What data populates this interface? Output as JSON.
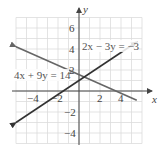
{
  "chart_data": {
    "type": "line",
    "title": "",
    "xlabel": "x",
    "ylabel": "y",
    "xlim": [
      -6,
      6
    ],
    "ylim": [
      -5,
      7
    ],
    "grid": true,
    "x_ticks": [
      -4,
      -2,
      2,
      4
    ],
    "y_ticks": [
      6,
      4,
      2,
      -2,
      -4
    ],
    "x_tick_labels": [
      "−4",
      "−2",
      "2",
      "4"
    ],
    "y_tick_labels": [
      "6",
      "4",
      "2",
      "−2",
      "−4"
    ],
    "series": [
      {
        "name": "2x − 3y = −3",
        "equation": "2x - 3y = -3",
        "color": "#333333",
        "x": [
          -6,
          5.5
        ],
        "y": [
          -3,
          4.667
        ]
      },
      {
        "name": "4x + 9y = 14",
        "equation": "4x + 9y = 14",
        "color": "#666666",
        "x": [
          -6,
          5.5
        ],
        "y": [
          4.222,
          -0.889
        ]
      }
    ],
    "annotations": [
      {
        "text": "2x − 3y = −3",
        "x": 0.6,
        "y": 4
      },
      {
        "text": "4x + 9y = 14",
        "x": -5.8,
        "y": 1.2
      }
    ],
    "intersection": {
      "x": 0.5,
      "y": 1.333
    }
  },
  "labels": {
    "eq1": "2x − 3y = −3",
    "eq2": "4x + 9y = 14",
    "x_axis": "x",
    "y_axis": "y",
    "xt0": "−4",
    "xt1": "−2",
    "xt2": "2",
    "xt3": "4",
    "yt0": "6",
    "yt1": "4",
    "yt2": "2",
    "yt3": "−2",
    "yt4": "−4"
  }
}
